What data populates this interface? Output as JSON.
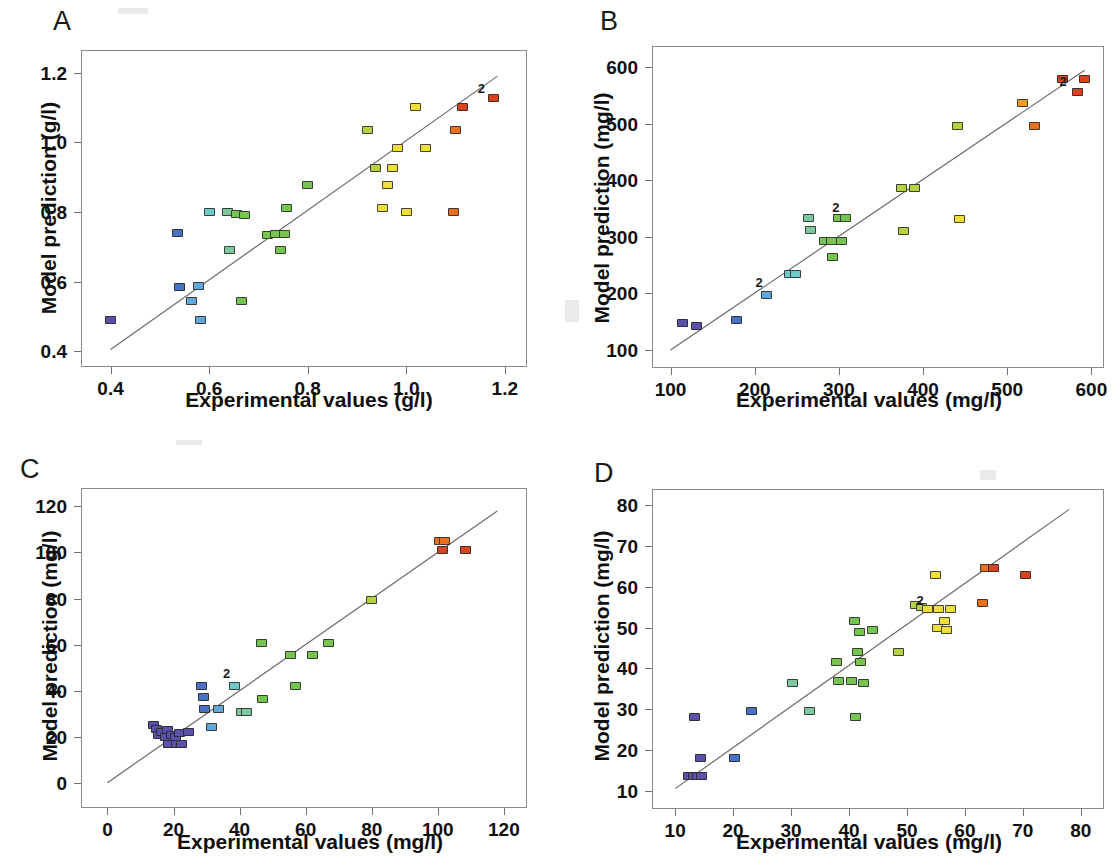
{
  "figure": {
    "type": "multi-panel-scatter",
    "panel_count": 4,
    "layout": "2x2",
    "background": "#ffffff",
    "marker_shape": "filled-square",
    "marker_colormap": "rainbow-blue-to-red",
    "reference_line": "1:1 identity line",
    "duplicate_marker_label": "2"
  },
  "colors": {
    "line": "#6b6b6b",
    "frame": "#8a8a8a",
    "text": "#101010",
    "c_violet": "#5b51a8",
    "c_blue": "#4a72c4",
    "c_lightblue": "#62a8d8",
    "c_cyan": "#6fc9c9",
    "c_teal": "#7ec8a0",
    "c_green": "#78c451",
    "c_yellowgreen": "#b5d340",
    "c_yellow": "#edde3a",
    "c_orange": "#ef9a2c",
    "c_darkorange": "#e8701f",
    "c_red": "#d8441f"
  },
  "panels": [
    {
      "id": "A",
      "letter": "A",
      "xlabel": "Experimental values (g/l)",
      "ylabel": "Model prediction (g/l)",
      "xticks": [
        "0.4",
        "0.6",
        "0.8",
        "1.0",
        "1.2"
      ],
      "yticks": [
        "0.4",
        "0.6",
        "0.8",
        "1.0",
        "1.2"
      ],
      "xlim": [
        0.34,
        1.245
      ],
      "ylim": [
        0.355,
        1.265
      ],
      "line": {
        "x1": 0.4,
        "y1": 0.405,
        "x2": 1.185,
        "y2": 1.19
      }
    },
    {
      "id": "B",
      "letter": "B",
      "xlabel": "Experimental values (mg/l)",
      "ylabel": "Model prediction (mg/l)",
      "xticks": [
        "100",
        "200",
        "300",
        "400",
        "500",
        "600"
      ],
      "yticks": [
        "100",
        "200",
        "300",
        "400",
        "500",
        "600"
      ],
      "xlim": [
        78,
        615
      ],
      "ylim": [
        68,
        638
      ],
      "line": {
        "x1": 100,
        "y1": 100,
        "x2": 592,
        "y2": 595
      }
    },
    {
      "id": "C",
      "letter": "C",
      "xlabel": "Experimental values (mg/l)",
      "ylabel": "Model prediction (mg/l)",
      "xticks": [
        "0",
        "20",
        "40",
        "60",
        "80",
        "100",
        "120"
      ],
      "yticks": [
        "0",
        "20",
        "40",
        "60",
        "80",
        "100",
        "120"
      ],
      "xlim": [
        -8,
        127
      ],
      "ylim": [
        -11,
        128
      ],
      "line": {
        "x1": 0,
        "y1": 0,
        "x2": 118,
        "y2": 118
      }
    },
    {
      "id": "D",
      "letter": "D",
      "xlabel": "Experimental values (mg/l)",
      "ylabel": "Model prediction (mg/l)",
      "xticks": [
        "10",
        "20",
        "30",
        "40",
        "50",
        "60",
        "70",
        "80"
      ],
      "yticks": [
        "10",
        "20",
        "30",
        "40",
        "50",
        "60",
        "70",
        "80"
      ],
      "xlim": [
        6,
        84
      ],
      "ylim": [
        5.5,
        84
      ],
      "line": {
        "x1": 10,
        "y1": 10.5,
        "x2": 78,
        "y2": 79
      }
    }
  ],
  "chart_data": [
    {
      "type": "scatter",
      "panel": "A",
      "title": "A",
      "xlabel": "Experimental values (g/l)",
      "ylabel": "Model prediction (g/l)",
      "xlim": [
        0.34,
        1.245
      ],
      "ylim": [
        0.355,
        1.265
      ],
      "xticks": [
        0.4,
        0.6,
        0.8,
        1.0,
        1.2
      ],
      "yticks": [
        0.4,
        0.6,
        0.8,
        1.0,
        1.2
      ],
      "grid": false,
      "legend": "none",
      "reference_line": {
        "type": "identity",
        "x": [
          0.4,
          1.185
        ],
        "y": [
          0.405,
          1.19
        ]
      },
      "annotations": [
        {
          "text": "2",
          "x": 1.155,
          "y": 1.135
        }
      ],
      "points": [
        {
          "x": 0.4,
          "y": 0.49,
          "color": "#5b51a8"
        },
        {
          "x": 0.535,
          "y": 0.74,
          "color": "#4a72c4"
        },
        {
          "x": 0.54,
          "y": 0.585,
          "color": "#4a72c4"
        },
        {
          "x": 0.565,
          "y": 0.545,
          "color": "#62a8d8"
        },
        {
          "x": 0.578,
          "y": 0.588,
          "color": "#62a8d8"
        },
        {
          "x": 0.583,
          "y": 0.49,
          "color": "#62a8d8"
        },
        {
          "x": 0.6,
          "y": 0.8,
          "color": "#6fc9c9"
        },
        {
          "x": 0.638,
          "y": 0.8,
          "color": "#7ec8a0"
        },
        {
          "x": 0.642,
          "y": 0.69,
          "color": "#7ec8a0"
        },
        {
          "x": 0.655,
          "y": 0.793,
          "color": "#78c451"
        },
        {
          "x": 0.665,
          "y": 0.545,
          "color": "#78c451"
        },
        {
          "x": 0.672,
          "y": 0.792,
          "color": "#78c451"
        },
        {
          "x": 0.718,
          "y": 0.735,
          "color": "#78c451"
        },
        {
          "x": 0.735,
          "y": 0.737,
          "color": "#78c451"
        },
        {
          "x": 0.745,
          "y": 0.69,
          "color": "#78c451"
        },
        {
          "x": 0.752,
          "y": 0.738,
          "color": "#78c451"
        },
        {
          "x": 0.757,
          "y": 0.812,
          "color": "#78c451"
        },
        {
          "x": 0.8,
          "y": 0.878,
          "color": "#78c451"
        },
        {
          "x": 0.922,
          "y": 1.035,
          "color": "#b5d340"
        },
        {
          "x": 0.938,
          "y": 0.925,
          "color": "#b5d340"
        },
        {
          "x": 0.952,
          "y": 0.812,
          "color": "#edde3a"
        },
        {
          "x": 0.962,
          "y": 0.878,
          "color": "#edde3a"
        },
        {
          "x": 0.972,
          "y": 0.925,
          "color": "#edde3a"
        },
        {
          "x": 0.982,
          "y": 0.983,
          "color": "#edde3a"
        },
        {
          "x": 1.0,
          "y": 0.8,
          "color": "#edde3a"
        },
        {
          "x": 1.018,
          "y": 1.1,
          "color": "#edde3a"
        },
        {
          "x": 1.04,
          "y": 0.983,
          "color": "#edde3a"
        },
        {
          "x": 1.095,
          "y": 0.8,
          "color": "#e8701f"
        },
        {
          "x": 1.1,
          "y": 1.035,
          "color": "#e8701f"
        },
        {
          "x": 1.115,
          "y": 1.102,
          "color": "#d8441f"
        },
        {
          "x": 1.178,
          "y": 1.128,
          "color": "#d8441f"
        }
      ]
    },
    {
      "type": "scatter",
      "panel": "B",
      "title": "B",
      "xlabel": "Experimental values (mg/l)",
      "ylabel": "Model prediction (mg/l)",
      "xlim": [
        78,
        615
      ],
      "ylim": [
        68,
        638
      ],
      "xticks": [
        100,
        200,
        300,
        400,
        500,
        600
      ],
      "yticks": [
        100,
        200,
        300,
        400,
        500,
        600
      ],
      "grid": false,
      "legend": "none",
      "reference_line": {
        "type": "identity",
        "x": [
          100,
          592
        ],
        "y": [
          100,
          595
        ]
      },
      "annotations": [
        {
          "text": "2",
          "x": 207,
          "y": 207
        },
        {
          "text": "2",
          "x": 298,
          "y": 340
        },
        {
          "text": "2",
          "x": 568,
          "y": 563
        }
      ],
      "points": [
        {
          "x": 114,
          "y": 148,
          "color": "#5b51a8"
        },
        {
          "x": 131,
          "y": 143,
          "color": "#5b51a8"
        },
        {
          "x": 178,
          "y": 153,
          "color": "#4a72c4"
        },
        {
          "x": 214,
          "y": 198,
          "color": "#62a8d8"
        },
        {
          "x": 241,
          "y": 235,
          "color": "#6fc9c9"
        },
        {
          "x": 249,
          "y": 235,
          "color": "#6fc9c9"
        },
        {
          "x": 264,
          "y": 334,
          "color": "#7ec8a0"
        },
        {
          "x": 266,
          "y": 312,
          "color": "#7ec8a0"
        },
        {
          "x": 283,
          "y": 292,
          "color": "#78c451"
        },
        {
          "x": 291,
          "y": 292,
          "color": "#78c451"
        },
        {
          "x": 293,
          "y": 265,
          "color": "#78c451"
        },
        {
          "x": 300,
          "y": 334,
          "color": "#78c451"
        },
        {
          "x": 303,
          "y": 292,
          "color": "#78c451"
        },
        {
          "x": 308,
          "y": 334,
          "color": "#78c451"
        },
        {
          "x": 374,
          "y": 386,
          "color": "#b5d340"
        },
        {
          "x": 377,
          "y": 311,
          "color": "#b5d340"
        },
        {
          "x": 390,
          "y": 387,
          "color": "#b5d340"
        },
        {
          "x": 441,
          "y": 496,
          "color": "#b5d340"
        },
        {
          "x": 443,
          "y": 332,
          "color": "#edde3a"
        },
        {
          "x": 518,
          "y": 537,
          "color": "#ef9a2c"
        },
        {
          "x": 533,
          "y": 496,
          "color": "#e8701f"
        },
        {
          "x": 566,
          "y": 579,
          "color": "#d8441f"
        },
        {
          "x": 583,
          "y": 557,
          "color": "#d8441f"
        },
        {
          "x": 592,
          "y": 579,
          "color": "#d8441f"
        }
      ]
    },
    {
      "type": "scatter",
      "panel": "C",
      "title": "C",
      "xlabel": "Experimental values (mg/l)",
      "ylabel": "Model prediction (mg/l)",
      "xlim": [
        -8,
        127
      ],
      "ylim": [
        -11,
        128
      ],
      "xticks": [
        0,
        20,
        40,
        60,
        80,
        100,
        120
      ],
      "yticks": [
        0,
        20,
        40,
        60,
        80,
        100,
        120
      ],
      "grid": false,
      "legend": "none",
      "reference_line": {
        "type": "identity",
        "x": [
          0,
          118
        ],
        "y": [
          0,
          118
        ]
      },
      "annotations": [
        {
          "text": "2",
          "x": 36.5,
          "y": 44.5
        }
      ],
      "points": [
        {
          "x": 14.0,
          "y": 25.0,
          "color": "#5b51a8"
        },
        {
          "x": 14.8,
          "y": 23.5,
          "color": "#5b51a8"
        },
        {
          "x": 15.5,
          "y": 20.5,
          "color": "#5b51a8"
        },
        {
          "x": 16.5,
          "y": 22.0,
          "color": "#5b51a8"
        },
        {
          "x": 17.5,
          "y": 20.0,
          "color": "#5b51a8"
        },
        {
          "x": 18.2,
          "y": 23.0,
          "color": "#5b51a8"
        },
        {
          "x": 18.5,
          "y": 17.0,
          "color": "#5b51a8"
        },
        {
          "x": 19.5,
          "y": 20.5,
          "color": "#5b51a8"
        },
        {
          "x": 20.5,
          "y": 20.0,
          "color": "#5b51a8"
        },
        {
          "x": 21.0,
          "y": 17.0,
          "color": "#5b51a8"
        },
        {
          "x": 21.8,
          "y": 21.5,
          "color": "#5b51a8"
        },
        {
          "x": 22.5,
          "y": 17.0,
          "color": "#5b51a8"
        },
        {
          "x": 24.5,
          "y": 22.0,
          "color": "#5b51a8"
        },
        {
          "x": 28.5,
          "y": 42.0,
          "color": "#4a72c4"
        },
        {
          "x": 29.0,
          "y": 37.0,
          "color": "#4a72c4"
        },
        {
          "x": 29.5,
          "y": 32.0,
          "color": "#4a72c4"
        },
        {
          "x": 31.5,
          "y": 24.0,
          "color": "#62a8d8"
        },
        {
          "x": 33.5,
          "y": 32.0,
          "color": "#62a8d8"
        },
        {
          "x": 38.5,
          "y": 42.0,
          "color": "#6fc9c9"
        },
        {
          "x": 40.5,
          "y": 30.5,
          "color": "#7ec8a0"
        },
        {
          "x": 42.0,
          "y": 30.5,
          "color": "#7ec8a0"
        },
        {
          "x": 46.5,
          "y": 60.5,
          "color": "#78c451"
        },
        {
          "x": 47.0,
          "y": 36.5,
          "color": "#78c451"
        },
        {
          "x": 55.5,
          "y": 55.5,
          "color": "#78c451"
        },
        {
          "x": 57.0,
          "y": 42.0,
          "color": "#78c451"
        },
        {
          "x": 62.0,
          "y": 55.5,
          "color": "#78c451"
        },
        {
          "x": 67.0,
          "y": 60.5,
          "color": "#78c451"
        },
        {
          "x": 80.0,
          "y": 79.5,
          "color": "#b5d340"
        },
        {
          "x": 100.5,
          "y": 105.0,
          "color": "#e8701f"
        },
        {
          "x": 102.0,
          "y": 105.0,
          "color": "#e8701f"
        },
        {
          "x": 101.5,
          "y": 101.0,
          "color": "#d8441f"
        },
        {
          "x": 108.5,
          "y": 101.0,
          "color": "#d8441f"
        }
      ]
    },
    {
      "type": "scatter",
      "panel": "D",
      "title": "D",
      "xlabel": "Experimental values (mg/l)",
      "ylabel": "Model prediction (mg/l)",
      "xlim": [
        6,
        84
      ],
      "ylim": [
        5.5,
        84
      ],
      "xticks": [
        10,
        20,
        30,
        40,
        50,
        60,
        70,
        80
      ],
      "yticks": [
        10,
        20,
        30,
        40,
        50,
        60,
        70,
        80
      ],
      "grid": false,
      "legend": "none",
      "reference_line": {
        "type": "identity",
        "x": [
          10,
          78
        ],
        "y": [
          10.5,
          79
        ]
      },
      "annotations": [
        {
          "text": "2",
          "x": 52.5,
          "y": 55.0
        }
      ],
      "points": [
        {
          "x": 12.3,
          "y": 13.5,
          "color": "#5b51a8"
        },
        {
          "x": 13.2,
          "y": 13.5,
          "color": "#5b51a8"
        },
        {
          "x": 13.3,
          "y": 28.0,
          "color": "#5b51a8"
        },
        {
          "x": 13.8,
          "y": 13.5,
          "color": "#5b51a8"
        },
        {
          "x": 14.3,
          "y": 18.0,
          "color": "#5b51a8"
        },
        {
          "x": 14.5,
          "y": 13.5,
          "color": "#5b51a8"
        },
        {
          "x": 20.3,
          "y": 18.0,
          "color": "#4a72c4"
        },
        {
          "x": 23.2,
          "y": 29.5,
          "color": "#4a72c4"
        },
        {
          "x": 30.3,
          "y": 36.5,
          "color": "#7ec8a0"
        },
        {
          "x": 33.2,
          "y": 29.5,
          "color": "#7ec8a0"
        },
        {
          "x": 37.8,
          "y": 41.5,
          "color": "#78c451"
        },
        {
          "x": 38.2,
          "y": 37.0,
          "color": "#78c451"
        },
        {
          "x": 40.5,
          "y": 37.0,
          "color": "#78c451"
        },
        {
          "x": 41.0,
          "y": 51.5,
          "color": "#78c451"
        },
        {
          "x": 41.2,
          "y": 28.0,
          "color": "#78c451"
        },
        {
          "x": 41.5,
          "y": 44.0,
          "color": "#78c451"
        },
        {
          "x": 41.8,
          "y": 49.0,
          "color": "#78c451"
        },
        {
          "x": 42.0,
          "y": 41.5,
          "color": "#78c451"
        },
        {
          "x": 42.5,
          "y": 36.5,
          "color": "#78c451"
        },
        {
          "x": 44.0,
          "y": 49.5,
          "color": "#78c451"
        },
        {
          "x": 48.5,
          "y": 44.0,
          "color": "#b5d340"
        },
        {
          "x": 51.5,
          "y": 55.5,
          "color": "#b5d340"
        },
        {
          "x": 52.5,
          "y": 55.0,
          "color": "#b5d340"
        },
        {
          "x": 53.5,
          "y": 54.5,
          "color": "#edde3a"
        },
        {
          "x": 55.0,
          "y": 63.0,
          "color": "#edde3a"
        },
        {
          "x": 55.2,
          "y": 50.0,
          "color": "#edde3a"
        },
        {
          "x": 55.5,
          "y": 54.5,
          "color": "#edde3a"
        },
        {
          "x": 56.5,
          "y": 51.5,
          "color": "#edde3a"
        },
        {
          "x": 56.8,
          "y": 49.5,
          "color": "#edde3a"
        },
        {
          "x": 57.5,
          "y": 54.5,
          "color": "#edde3a"
        },
        {
          "x": 63.0,
          "y": 56.0,
          "color": "#e8701f"
        },
        {
          "x": 63.5,
          "y": 64.5,
          "color": "#e8701f"
        },
        {
          "x": 65.0,
          "y": 64.5,
          "color": "#d8441f"
        },
        {
          "x": 70.5,
          "y": 63.0,
          "color": "#d8441f"
        }
      ]
    }
  ]
}
